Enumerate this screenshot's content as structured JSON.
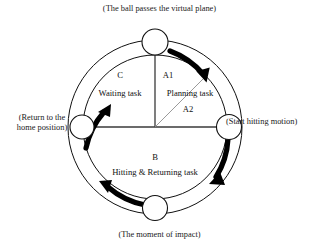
{
  "figure": {
    "type": "cycle-diagram",
    "colors": {
      "stroke": "#111111",
      "divider": "#3a3a3a",
      "thin_divider": "#8a8a8a",
      "arrow": "#000000",
      "background": "#ffffff"
    },
    "geometry": {
      "center_x": 155,
      "center_y": 127,
      "outer_radius": 87,
      "inner_radius": 72,
      "node_radius": 12
    }
  },
  "outer_labels": {
    "top": "(The ball passes the virtual plane)",
    "right": "Start hitting motion",
    "bottom": "(The moment of impact)",
    "left_line1": "(Return to the",
    "left_line2": "home position)"
  },
  "right_label_full": "(Start hitting motion)",
  "sectors": [
    {
      "id": "A1",
      "code": "A1",
      "name": "Planning task",
      "position": "upper-right"
    },
    {
      "id": "A2",
      "code": "A2",
      "name": "",
      "position": "right-lower-of-diagonal"
    },
    {
      "id": "B",
      "code": "B",
      "name": "Hitting & Returning task",
      "position": "bottom"
    },
    {
      "id": "C",
      "code": "C",
      "name": "Waiting task",
      "position": "upper-left"
    }
  ],
  "nodes": [
    {
      "id": "node-top",
      "label": "(The ball passes the virtual plane)"
    },
    {
      "id": "node-right",
      "label": "(Start hitting motion)"
    },
    {
      "id": "node-bottom",
      "label": "(The moment of impact)"
    },
    {
      "id": "node-left",
      "label": "(Return to the home position)"
    }
  ],
  "arrows": [
    {
      "id": "arrow-top-right",
      "direction": "clockwise",
      "from": "node-top",
      "to": "node-right"
    },
    {
      "id": "arrow-right-bottom",
      "direction": "clockwise",
      "from": "node-right",
      "to": "node-bottom"
    },
    {
      "id": "arrow-bottom-left",
      "direction": "clockwise",
      "from": "node-bottom",
      "to": "node-left"
    },
    {
      "id": "arrow-left-top",
      "direction": "clockwise",
      "from": "node-left",
      "to": "node-top"
    }
  ]
}
